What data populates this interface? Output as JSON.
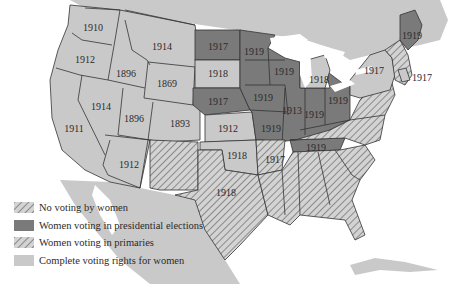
{
  "map": {
    "type": "choropleth",
    "subject": "Women's suffrage in the United States before the Nineteenth Amendment",
    "colors": {
      "land": "#c9c9c9",
      "presidential": "#7a7a7a",
      "hatch_fg": "#8a8a8a",
      "hatch_bg": "#d3d3d3",
      "border": "#333333",
      "water": "#ffffff"
    },
    "state_labels": [
      {
        "year": "1910",
        "x": 93,
        "y": 27
      },
      {
        "year": "1912",
        "x": 85,
        "y": 59
      },
      {
        "year": "1896",
        "x": 126,
        "y": 73
      },
      {
        "year": "1914",
        "x": 162,
        "y": 46
      },
      {
        "year": "1869",
        "x": 167,
        "y": 83
      },
      {
        "year": "1917",
        "x": 218,
        "y": 46
      },
      {
        "year": "1918",
        "x": 218,
        "y": 73
      },
      {
        "year": "1917",
        "x": 218,
        "y": 101
      },
      {
        "year": "1919",
        "x": 254,
        "y": 51
      },
      {
        "year": "1919",
        "x": 284,
        "y": 71
      },
      {
        "year": "1918",
        "x": 319,
        "y": 79
      },
      {
        "year": "1914",
        "x": 101,
        "y": 106
      },
      {
        "year": "1896",
        "x": 134,
        "y": 118
      },
      {
        "year": "1893",
        "x": 180,
        "y": 123
      },
      {
        "year": "1919",
        "x": 263,
        "y": 97
      },
      {
        "year": "1913",
        "x": 292,
        "y": 110
      },
      {
        "year": "1919",
        "x": 314,
        "y": 114
      },
      {
        "year": "1919",
        "x": 338,
        "y": 100
      },
      {
        "year": "1911",
        "x": 74,
        "y": 128
      },
      {
        "year": "1912",
        "x": 228,
        "y": 128
      },
      {
        "year": "1919",
        "x": 271,
        "y": 128
      },
      {
        "year": "1912",
        "x": 129,
        "y": 164
      },
      {
        "year": "1918",
        "x": 237,
        "y": 155
      },
      {
        "year": "1917",
        "x": 275,
        "y": 159
      },
      {
        "year": "1919",
        "x": 316,
        "y": 147
      },
      {
        "year": "1918",
        "x": 226,
        "y": 192
      },
      {
        "year": "1917",
        "x": 374,
        "y": 70
      },
      {
        "year": "1917",
        "x": 422,
        "y": 77
      },
      {
        "year": "1919",
        "x": 412,
        "y": 35
      }
    ]
  },
  "legend": {
    "items": [
      {
        "key": "none",
        "label": "No voting by women"
      },
      {
        "key": "presidential",
        "label": "Women voting in presidential elections"
      },
      {
        "key": "primaries",
        "label": "Women voting in primaries"
      },
      {
        "key": "complete",
        "label": "Complete voting rights for women"
      }
    ]
  }
}
